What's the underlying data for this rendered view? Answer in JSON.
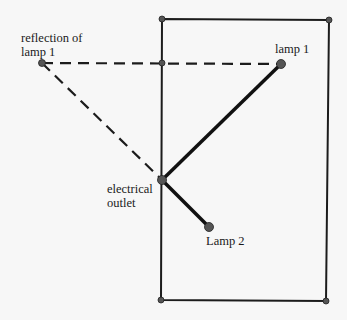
{
  "colors": {
    "background": "#f7f7f7",
    "line": "#1c1c1c",
    "point": "#555555",
    "point_stroke": "#222222"
  },
  "labels": {
    "reflection_line1": "reflection of",
    "reflection_line2": "lamp 1",
    "lamp1": "lamp 1",
    "outlet_line1": "electrical",
    "outlet_line2": "outlet",
    "lamp2": "Lamp 2"
  },
  "points": {
    "reflection": {
      "x": 42,
      "y": 63
    },
    "lamp1": {
      "x": 281,
      "y": 64
    },
    "outlet": {
      "x": 162,
      "y": 180
    },
    "lamp2": {
      "x": 209,
      "y": 227
    },
    "mirror_intersection": {
      "x": 162,
      "y": 63
    },
    "room_top_left": {
      "x": 162,
      "y": 19
    },
    "room_top_right": {
      "x": 329,
      "y": 20
    },
    "room_bottom_left": {
      "x": 161,
      "y": 300
    },
    "room_bottom_right": {
      "x": 326,
      "y": 301
    }
  }
}
